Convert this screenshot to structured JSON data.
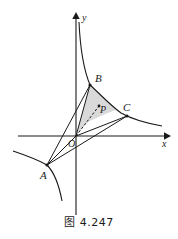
{
  "figure": {
    "caption": "图 4.247",
    "axes": {
      "x_label": "x",
      "y_label": "y",
      "origin_label": "O"
    },
    "points": [
      {
        "name": "A",
        "label": "A",
        "x": 47,
        "y": 165
      },
      {
        "name": "B",
        "label": "B",
        "x": 90,
        "y": 85
      },
      {
        "name": "C",
        "label": "C",
        "x": 127,
        "y": 116
      },
      {
        "name": "P",
        "label": "P",
        "x": 98,
        "y": 107
      }
    ],
    "colors": {
      "stroke": "#1a1a1a",
      "shade_fill": "#d9d9d9",
      "background": "#ffffff"
    },
    "elements": {
      "hyperbola_upper_branch": "curve through B and C",
      "hyperbola_lower_branch": "curve through A",
      "segment_AB": "A to B",
      "segment_AC": "A to C",
      "segment_AO": "A to O",
      "segment_OB": "O to B",
      "segment_OC": "O to C",
      "segment_OP_dashed": "O to P dashed",
      "shaded_region": "region bounded by O, B, arc BC"
    }
  }
}
